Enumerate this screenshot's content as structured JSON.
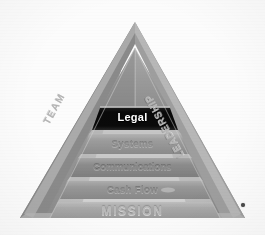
{
  "diagram": {
    "background_color": "#fcfcfc",
    "apex": {
      "x": 135,
      "y": 22
    },
    "base_left": {
      "x": 20,
      "y": 218
    },
    "base_right": {
      "x": 245,
      "y": 218
    },
    "bands": [
      {
        "id": "legal",
        "label": "Legal",
        "rank": 1,
        "state": "highlighted",
        "fill_color": "#0d0d0d",
        "text_color": "#ffffff"
      },
      {
        "id": "systems",
        "label": "Systems",
        "rank": 2,
        "state": "normal",
        "fill_color": "#9a9a9a",
        "text_color": "#8e8e8e"
      },
      {
        "id": "communications",
        "label": "Communications",
        "rank": 3,
        "state": "normal",
        "fill_color": "#8f8f8f",
        "text_color": "#8a8a8a"
      },
      {
        "id": "cash-flow",
        "label": "Cash Flow",
        "rank": 4,
        "state": "normal",
        "fill_color": "#979797",
        "text_color": "#8d8d8d"
      },
      {
        "id": "mission",
        "label": "MISSION",
        "rank": 5,
        "state": "base",
        "fill_color": "#a6a6a6",
        "text_color": "#b9b9b9"
      }
    ],
    "edge_labels": [
      {
        "id": "team",
        "label": "TEAM",
        "side": "left",
        "color": "#b4b4b4"
      },
      {
        "id": "leadership",
        "label": "LEADERSHIP",
        "side": "right",
        "color": "#b4b4b4"
      }
    ],
    "faces": {
      "left_face_color": "#8b8b8b",
      "right_face_color": "#a3a3a3",
      "highlight_color": "#d8d8d8"
    },
    "marker": {
      "id": "corner-dot",
      "color": "#4a4a4a"
    }
  }
}
